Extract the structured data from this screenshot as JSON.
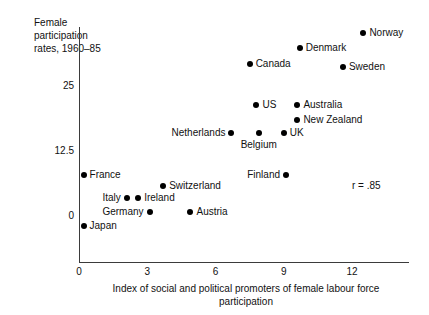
{
  "chart_data": {
    "type": "scatter",
    "title": "",
    "ylabel": "Female participation rates, 1960–85",
    "xlabel": "Index of social and political promoters of female labour force participation",
    "xlim": [
      -0.6,
      14.4
    ],
    "ylim": [
      -4.2,
      27.5
    ],
    "xticks": [
      0,
      3,
      6,
      9,
      12
    ],
    "xticklabels": [
      "0",
      "3",
      "6",
      "9",
      "12"
    ],
    "yticks": [
      0,
      12.5,
      25
    ],
    "yticklabels": [
      "0",
      "12.5",
      "25"
    ],
    "grid": false,
    "legend": false,
    "annotations": [
      {
        "name": "correlation",
        "text": "r = .85",
        "x": 12.0,
        "y": 5.6
      }
    ],
    "points": [
      {
        "label": "Norway",
        "x": 12.5,
        "y": 35.0,
        "label_side": "right"
      },
      {
        "label": "Denmark",
        "x": 9.7,
        "y": 32.1,
        "label_side": "right"
      },
      {
        "label": "Sweden",
        "x": 11.6,
        "y": 28.5,
        "label_side": "right"
      },
      {
        "label": "Canada",
        "x": 7.5,
        "y": 29.0,
        "label_side": "right"
      },
      {
        "label": "US",
        "x": 7.8,
        "y": 21.2,
        "label_side": "right"
      },
      {
        "label": "Australia",
        "x": 9.6,
        "y": 21.2,
        "label_side": "right"
      },
      {
        "label": "New Zealand",
        "x": 9.6,
        "y": 18.3,
        "label_side": "right"
      },
      {
        "label": "UK",
        "x": 9.0,
        "y": 15.8,
        "label_side": "right"
      },
      {
        "label": "Belgium",
        "x": 7.9,
        "y": 15.8,
        "label_side": "below"
      },
      {
        "label": "Netherlands",
        "x": 6.7,
        "y": 15.8,
        "label_side": "left"
      },
      {
        "label": "Finland",
        "x": 9.1,
        "y": 7.7,
        "label_side": "left"
      },
      {
        "label": "France",
        "x": 0.2,
        "y": 7.7,
        "label_side": "right"
      },
      {
        "label": "Switzerland",
        "x": 3.7,
        "y": 5.6,
        "label_side": "right"
      },
      {
        "label": "Italy",
        "x": 2.1,
        "y": 3.3,
        "label_side": "left"
      },
      {
        "label": "Ireland",
        "x": 2.6,
        "y": 3.3,
        "label_side": "right"
      },
      {
        "label": "Germany",
        "x": 3.1,
        "y": 0.5,
        "label_side": "left"
      },
      {
        "label": "Austria",
        "x": 4.9,
        "y": 0.5,
        "label_side": "right"
      },
      {
        "label": "Japan",
        "x": 0.2,
        "y": -2.2,
        "label_side": "right"
      }
    ]
  },
  "axis_titles": {
    "y": "Female participation rates, 1960–85",
    "x": "Index of social and political promoters of female labour force participation"
  }
}
